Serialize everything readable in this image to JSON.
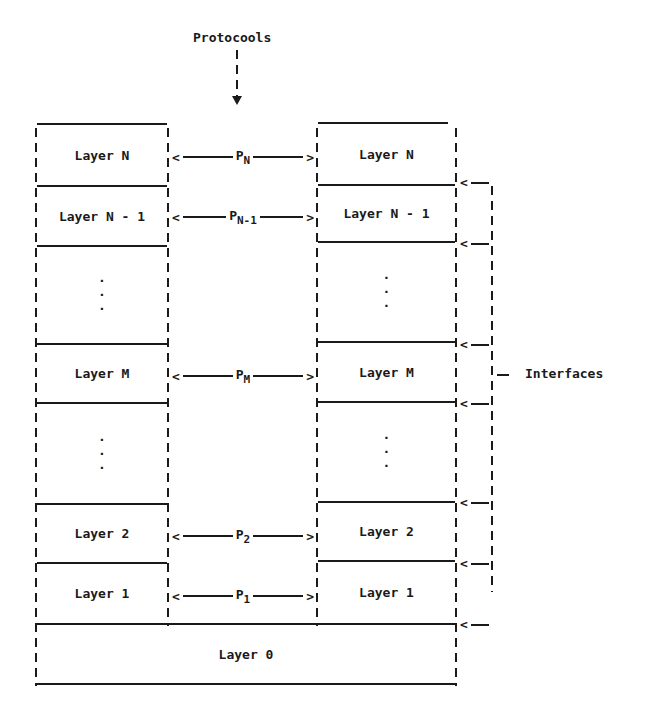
{
  "title_label": "Protocools",
  "interfaces_label": "Interfaces",
  "bottom_layer": "Layer 0",
  "rows": [
    {
      "left": "Layer N",
      "right": "Layer N",
      "protocol": "P",
      "sub": "N"
    },
    {
      "left": "Layer N - 1",
      "right": "Layer N - 1",
      "protocol": "P",
      "sub": "N-1"
    },
    {
      "left": ":",
      "right": ":",
      "protocol": "",
      "sub": ""
    },
    {
      "left": "Layer M",
      "right": "Layer M",
      "protocol": "P",
      "sub": "M"
    },
    {
      "left": ":",
      "right": ":",
      "protocol": "",
      "sub": ""
    },
    {
      "left": "Layer 2",
      "right": "Layer 2",
      "protocol": "P",
      "sub": "2"
    },
    {
      "left": "Layer 1",
      "right": "Layer 1",
      "protocol": "P",
      "sub": "1"
    }
  ],
  "arrows": {
    "left": "<",
    "right": ">",
    "interface": "<"
  }
}
